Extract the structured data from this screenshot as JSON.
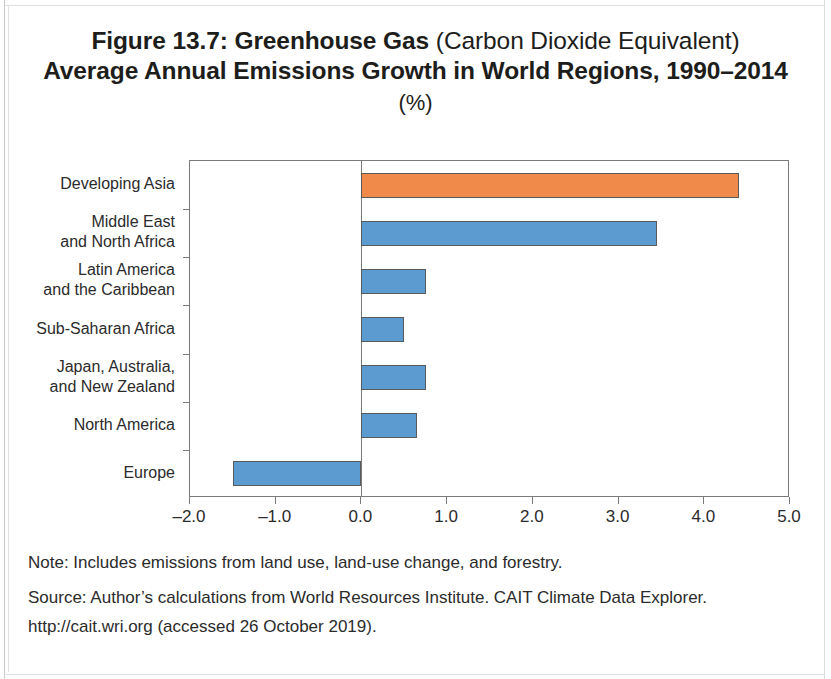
{
  "figure": {
    "title_line1_bold": "Figure 13.7: Greenhouse Gas",
    "title_line1_light": "(Carbon Dioxide Equivalent)",
    "title_line2": "Average Annual Emissions Growth in World Regions, 1990–2014",
    "title_units": "(%)",
    "note": "Note: Includes emissions from land use, land-use change, and forestry.",
    "source_line1": "Source: Author’s calculations from World Resources Institute. CAIT Climate Data Explorer.",
    "source_line2": "http://cait.wri.org (accessed 26 October 2019)."
  },
  "colors": {
    "highlight_bar": "#F08A4B",
    "default_bar": "#5B9BD0",
    "bar_border": "#5A5A5A",
    "axis": "#7A7A7A",
    "text": "#2B2B2B"
  },
  "chart_data": {
    "type": "bar",
    "orientation": "horizontal",
    "title": "Figure 13.7: Greenhouse Gas (Carbon Dioxide Equivalent) Average Annual Emissions Growth in World Regions, 1990–2014 (%)",
    "xlabel": "",
    "ylabel": "",
    "xlim": [
      -2.0,
      5.0
    ],
    "grid": false,
    "legend": false,
    "xticks": [
      "-2.0",
      "-1.0",
      "0.0",
      "1.0",
      "2.0",
      "3.0",
      "4.0",
      "5.0"
    ],
    "xtick_values": [
      -2.0,
      -1.0,
      0.0,
      1.0,
      2.0,
      3.0,
      4.0,
      5.0
    ],
    "categories": [
      "Developing Asia",
      "Middle East\nand North Africa",
      "Latin America\nand the Caribbean",
      "Sub-Saharan Africa",
      "Japan, Australia,\nand New Zealand",
      "North America",
      "Europe"
    ],
    "values": [
      4.4,
      3.45,
      0.75,
      0.5,
      0.75,
      0.65,
      -1.5
    ],
    "bar_colors": [
      "#F08A4B",
      "#5B9BD0",
      "#5B9BD0",
      "#5B9BD0",
      "#5B9BD0",
      "#5B9BD0",
      "#5B9BD0"
    ]
  }
}
